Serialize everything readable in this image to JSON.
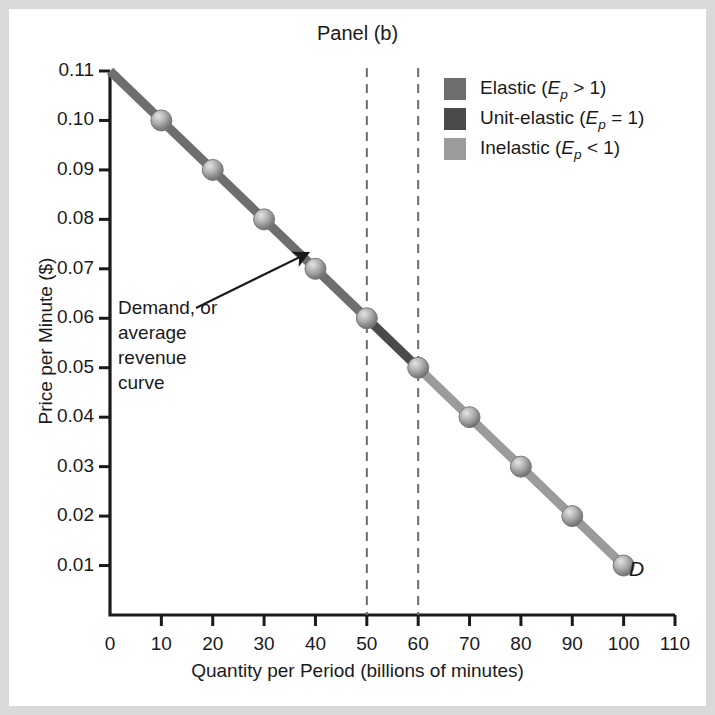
{
  "chart_data": {
    "type": "line",
    "title": "Panel (b)",
    "xlabel": "Quantity per Period (billions of minutes)",
    "ylabel": "Price per Minute ($)",
    "xlim": [
      0,
      110
    ],
    "ylim": [
      0,
      0.11
    ],
    "grid": false,
    "x_ticks": [
      0,
      10,
      20,
      30,
      40,
      50,
      60,
      70,
      80,
      90,
      100,
      110
    ],
    "y_ticks": [
      0.01,
      0.02,
      0.03,
      0.04,
      0.05,
      0.06,
      0.07,
      0.08,
      0.09,
      0.1,
      0.11
    ],
    "x_tick_labels": [
      "0",
      "10",
      "20",
      "30",
      "40",
      "50",
      "60",
      "70",
      "80",
      "90",
      "100",
      "110"
    ],
    "y_tick_labels": [
      "0.01",
      "0.02",
      "0.03",
      "0.04",
      "0.05",
      "0.06",
      "0.07",
      "0.08",
      "0.09",
      "0.10",
      "0.11"
    ],
    "series": [
      {
        "name": "Demand, or average revenue curve",
        "x": [
          0,
          10,
          20,
          30,
          40,
          50,
          60,
          70,
          80,
          90,
          100
        ],
        "y": [
          0.11,
          0.1,
          0.09,
          0.08,
          0.07,
          0.06,
          0.05,
          0.04,
          0.03,
          0.02,
          0.01
        ],
        "marker_x": [
          10,
          20,
          30,
          40,
          50,
          60,
          70,
          80,
          90,
          100
        ],
        "marker_y": [
          0.1,
          0.09,
          0.08,
          0.07,
          0.06,
          0.05,
          0.04,
          0.03,
          0.02,
          0.01
        ],
        "label": "D"
      }
    ],
    "segments": [
      {
        "name": "elastic",
        "x_from": 0,
        "x_to": 50,
        "color": "#6e6e6e"
      },
      {
        "name": "unit-elastic",
        "x_from": 50,
        "x_to": 60,
        "color": "#4a4a4a"
      },
      {
        "name": "inelastic",
        "x_from": 60,
        "x_to": 100,
        "color": "#9b9b9b"
      }
    ],
    "reference_lines": [
      {
        "name": "unit-elastic-left",
        "x": 50,
        "style": "dashed"
      },
      {
        "name": "unit-elastic-right",
        "x": 60,
        "style": "dashed"
      }
    ],
    "annotations": [
      {
        "name": "demand-curve-annotation",
        "text": "Demand, or\naverage\nrevenue\ncurve",
        "points_to_x": 38,
        "points_to_y": 0.072
      }
    ]
  },
  "legend": {
    "position": "top-right",
    "items": [
      {
        "name": "elastic",
        "label_prefix": "Elastic (",
        "symbol": "E",
        "subscript": "p",
        "relation": " > 1)",
        "color": "#6e6e6e"
      },
      {
        "name": "unit-elastic",
        "label_prefix": "Unit-elastic (",
        "symbol": "E",
        "subscript": "p",
        "relation": " = 1)",
        "color": "#4a4a4a"
      },
      {
        "name": "inelastic",
        "label_prefix": "Inelastic (",
        "symbol": "E",
        "subscript": "p",
        "relation": " < 1)",
        "color": "#9b9b9b"
      }
    ]
  },
  "colors": {
    "background": "#d9d9d9",
    "card": "#ffffff",
    "axis": "#1a1a1a",
    "text": "#1a1a1a",
    "elastic": "#6e6e6e",
    "unit_elastic": "#4a4a4a",
    "inelastic": "#9b9b9b"
  }
}
